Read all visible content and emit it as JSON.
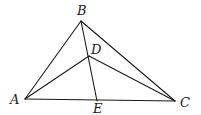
{
  "figure": {
    "type": "geometry-triangle",
    "points": {
      "A": {
        "x": 25,
        "y": 99
      },
      "B": {
        "x": 81,
        "y": 21
      },
      "C": {
        "x": 175,
        "y": 101
      },
      "D": {
        "x": 89,
        "y": 56
      },
      "E": {
        "x": 97,
        "y": 101
      }
    },
    "labels": {
      "A": "A",
      "B": "B",
      "C": "C",
      "D": "D",
      "E": "E"
    },
    "segments": [
      [
        "A",
        "B"
      ],
      [
        "B",
        "C"
      ],
      [
        "A",
        "C"
      ],
      [
        "A",
        "D"
      ],
      [
        "D",
        "C"
      ],
      [
        "B",
        "E"
      ]
    ],
    "colors": {
      "stroke": "#1a1a1a",
      "label": "#222222",
      "background": "#ffffff"
    }
  }
}
